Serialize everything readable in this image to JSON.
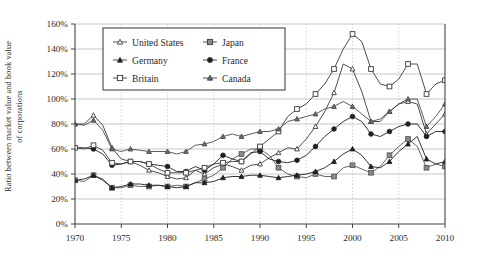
{
  "chart_data": {
    "type": "line",
    "title": "",
    "xlabel": "",
    "ylabel": "Ratio between market value and book value of corporations",
    "ylabel_line1": "Ratio between market value and book value",
    "ylabel_line2": "of corporations",
    "xlim": [
      1970,
      2010
    ],
    "ylim": [
      0,
      160
    ],
    "ytick_values": [
      0,
      20,
      40,
      60,
      80,
      100,
      120,
      140,
      160
    ],
    "ytick_labels": [
      "0%",
      "20%",
      "40%",
      "60%",
      "80%",
      "100%",
      "120%",
      "140%",
      "160%"
    ],
    "xtick_values": [
      1970,
      1975,
      1980,
      1985,
      1990,
      1995,
      2000,
      2005,
      2010
    ],
    "xtick_labels": [
      "1970",
      "1975",
      "1980",
      "1985",
      "1990",
      "1995",
      "2000",
      "2005",
      "2010"
    ],
    "grid": "horizontal-solid-and-vertical-dotted",
    "legend_position": "top-center-inside",
    "x": [
      1970,
      1971,
      1972,
      1973,
      1974,
      1975,
      1976,
      1977,
      1978,
      1979,
      1980,
      1981,
      1982,
      1983,
      1984,
      1985,
      1986,
      1987,
      1988,
      1989,
      1990,
      1991,
      1992,
      1993,
      1994,
      1995,
      1996,
      1997,
      1998,
      1999,
      2000,
      2001,
      2002,
      2003,
      2004,
      2005,
      2006,
      2007,
      2008,
      2009,
      2010
    ],
    "series": [
      {
        "name": "United States",
        "marker": "open-triangle",
        "color": "#3a3a3a",
        "values": [
          80,
          80,
          87,
          79,
          61,
          52,
          50,
          47,
          43,
          41,
          38,
          36,
          37,
          43,
          40,
          45,
          48,
          46,
          43,
          47,
          48,
          53,
          57,
          61,
          60,
          68,
          78,
          90,
          105,
          128,
          124,
          106,
          82,
          82,
          90,
          96,
          98,
          96,
          72,
          80,
          88
        ]
      },
      {
        "name": "Japan",
        "marker": "gray-square",
        "color": "#555555",
        "values": [
          35,
          34,
          39,
          36,
          29,
          29,
          31,
          30,
          30,
          31,
          30,
          31,
          30,
          33,
          36,
          39,
          45,
          52,
          56,
          60,
          60,
          55,
          45,
          40,
          38,
          37,
          40,
          38,
          38,
          45,
          47,
          44,
          41,
          46,
          55,
          62,
          68,
          62,
          45,
          48,
          46
        ]
      },
      {
        "name": "Germany",
        "marker": "filled-triangle",
        "color": "#1f1f1f",
        "values": [
          35,
          36,
          39,
          35,
          29,
          30,
          32,
          32,
          31,
          31,
          30,
          29,
          30,
          33,
          33,
          34,
          37,
          38,
          38,
          39,
          39,
          38,
          37,
          38,
          39,
          40,
          42,
          45,
          50,
          56,
          60,
          55,
          46,
          45,
          50,
          58,
          64,
          70,
          52,
          48,
          50
        ]
      },
      {
        "name": "France",
        "marker": "filled-circle",
        "color": "#1f1f1f",
        "values": [
          61,
          61,
          60,
          56,
          47,
          48,
          50,
          50,
          48,
          47,
          46,
          42,
          42,
          46,
          43,
          48,
          55,
          52,
          50,
          57,
          58,
          52,
          50,
          49,
          51,
          55,
          62,
          70,
          76,
          82,
          86,
          82,
          72,
          70,
          74,
          78,
          80,
          80,
          70,
          74,
          74
        ]
      },
      {
        "name": "Britain",
        "marker": "open-square",
        "color": "#3a3a3a",
        "values": [
          61,
          60,
          63,
          59,
          49,
          48,
          50,
          50,
          48,
          44,
          41,
          41,
          41,
          43,
          45,
          48,
          49,
          50,
          50,
          56,
          62,
          68,
          74,
          86,
          92,
          96,
          104,
          112,
          124,
          140,
          152,
          146,
          124,
          112,
          110,
          116,
          128,
          128,
          104,
          112,
          115
        ]
      },
      {
        "name": "Canada",
        "marker": "shaded-triangle",
        "color": "#4a4a4a",
        "values": [
          80,
          79,
          83,
          75,
          60,
          58,
          60,
          59,
          58,
          58,
          58,
          56,
          58,
          63,
          64,
          66,
          70,
          72,
          70,
          72,
          74,
          74,
          76,
          82,
          84,
          86,
          88,
          92,
          94,
          98,
          94,
          88,
          82,
          84,
          90,
          96,
          100,
          100,
          78,
          86,
          96
        ]
      }
    ],
    "legend": [
      {
        "label": "United States",
        "marker": "open-triangle"
      },
      {
        "label": "Japan",
        "marker": "gray-square"
      },
      {
        "label": "Germany",
        "marker": "filled-triangle"
      },
      {
        "label": "France",
        "marker": "filled-circle"
      },
      {
        "label": "Britain",
        "marker": "open-square"
      },
      {
        "label": "Canada",
        "marker": "shaded-triangle"
      }
    ]
  }
}
